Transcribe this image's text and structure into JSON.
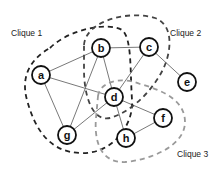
{
  "diagram": {
    "type": "graph-cliques",
    "nodes": [
      {
        "id": "a",
        "label": "a",
        "x": 41,
        "y": 75
      },
      {
        "id": "b",
        "label": "b",
        "x": 101,
        "y": 48
      },
      {
        "id": "c",
        "label": "c",
        "x": 149,
        "y": 47
      },
      {
        "id": "d",
        "label": "d",
        "x": 114,
        "y": 97
      },
      {
        "id": "e",
        "label": "e",
        "x": 187,
        "y": 82
      },
      {
        "id": "f",
        "label": "f",
        "x": 163,
        "y": 118
      },
      {
        "id": "g",
        "label": "g",
        "x": 67,
        "y": 135
      },
      {
        "id": "h",
        "label": "h",
        "x": 126,
        "y": 138
      }
    ],
    "edges": [
      [
        "a",
        "b"
      ],
      [
        "a",
        "d"
      ],
      [
        "a",
        "g"
      ],
      [
        "b",
        "c"
      ],
      [
        "b",
        "g"
      ],
      [
        "b",
        "d"
      ],
      [
        "c",
        "d"
      ],
      [
        "c",
        "e"
      ],
      [
        "d",
        "g"
      ],
      [
        "d",
        "f"
      ],
      [
        "d",
        "h"
      ],
      [
        "h",
        "f"
      ]
    ],
    "cliques": [
      {
        "label": "Clique 1",
        "members": [
          "a",
          "b",
          "d",
          "g"
        ],
        "color": "#222222"
      },
      {
        "label": "Clique 2",
        "members": [
          "b",
          "c",
          "d"
        ],
        "color": "#444444"
      },
      {
        "label": "Clique 3",
        "members": [
          "d",
          "f",
          "h"
        ],
        "color": "#9a9a9a"
      }
    ]
  },
  "labels": {
    "clique1": "Clique 1",
    "clique2": "Clique 2",
    "clique3": "Clique 3"
  },
  "node_labels": {
    "a": "a",
    "b": "b",
    "c": "c",
    "d": "d",
    "e": "e",
    "f": "f",
    "g": "g",
    "h": "h"
  }
}
